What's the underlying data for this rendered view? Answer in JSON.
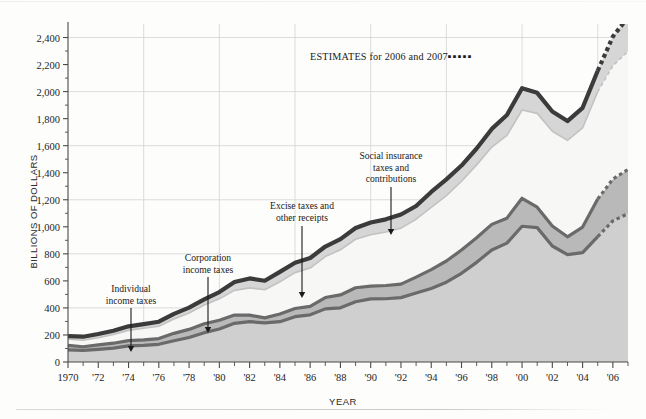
{
  "axes": {
    "ylabel": "BILLIONS OF DOLLARS",
    "xlabel": "YEAR",
    "yticks": [
      "0",
      "200",
      "400",
      "600",
      "800",
      "1,000",
      "1,200",
      "1,400",
      "1,600",
      "1,800",
      "2,000",
      "2,200",
      "2,400"
    ],
    "xticks": [
      "1970",
      "'72",
      "'74",
      "'76",
      "'78",
      "'80",
      "'82",
      "'84",
      "'86",
      "'88",
      "'90",
      "'92",
      "'94",
      "'96",
      "'98",
      "'00",
      "'02",
      "'04",
      "'06"
    ]
  },
  "estimates_note": {
    "text": "ESTIMATES for 2006 and 2007",
    "dots": "▪▪▪▪▪"
  },
  "annotations": [
    {
      "id": "individual",
      "label_line1": "Individual",
      "label_line2": "income taxes"
    },
    {
      "id": "corporation",
      "label_line1": "Corporation",
      "label_line2": "income taxes"
    },
    {
      "id": "excise",
      "label_line1": "Excise taxes and",
      "label_line2": "other receipts"
    },
    {
      "id": "social",
      "label_line1": "Social insurance",
      "label_line2": "taxes and",
      "label_line3": "contributions"
    }
  ],
  "colors": {
    "total_line": "#3b3b3b",
    "band_top_fill": "#d6d6d6",
    "band_social_fill": "#e8e8e8",
    "band_white_fill": "#f7f7f5",
    "band_corp_fill": "#b9b9b9",
    "band_corp_line": "#6a6a6a",
    "band_individual_fill": "#cfcfcf",
    "grid": "#d3d3d3",
    "axis": "#4a4a4a",
    "text": "#1a1a1a"
  },
  "chart_data": {
    "type": "area",
    "title": "",
    "subtitle": "",
    "xlabel": "YEAR",
    "ylabel": "BILLIONS OF DOLLARS",
    "xlim": [
      1970,
      2007
    ],
    "ylim": [
      0,
      2500
    ],
    "ytick_step": 200,
    "grid": "horizontal every 400, vertical every 5 years",
    "legend": "inline annotations with arrows",
    "estimates_years": [
      2006,
      2007
    ],
    "stack_order_bottom_to_top": [
      "Individual income taxes",
      "Corporation income taxes",
      "Excise taxes and other receipts",
      "Social insurance taxes and contributions"
    ],
    "x": [
      1970,
      1971,
      1972,
      1973,
      1974,
      1975,
      1976,
      1977,
      1978,
      1979,
      1980,
      1981,
      1982,
      1983,
      1984,
      1985,
      1986,
      1987,
      1988,
      1989,
      1990,
      1991,
      1992,
      1993,
      1994,
      1995,
      1996,
      1997,
      1998,
      1999,
      2000,
      2001,
      2002,
      2003,
      2004,
      2005,
      2006,
      2007
    ],
    "series": [
      {
        "name": "Individual income taxes",
        "values": [
          90,
          86,
          94,
          103,
          119,
          123,
          131,
          157,
          181,
          217,
          244,
          286,
          298,
          289,
          298,
          335,
          349,
          393,
          401,
          446,
          467,
          468,
          476,
          510,
          543,
          590,
          656,
          737,
          829,
          879,
          1004,
          994,
          858,
          794,
          809,
          927,
          1044,
          1097
        ]
      },
      {
        "name": "Corporation income taxes",
        "values": [
          33,
          27,
          32,
          36,
          39,
          41,
          42,
          55,
          60,
          66,
          65,
          61,
          49,
          37,
          57,
          61,
          63,
          84,
          95,
          103,
          94,
          98,
          100,
          118,
          140,
          157,
          172,
          182,
          189,
          185,
          207,
          151,
          148,
          132,
          189,
          278,
          309,
          327
        ]
      },
      {
        "name": "Social insurance taxes and contributions",
        "values": [
          45,
          48,
          53,
          64,
          76,
          86,
          92,
          106,
          121,
          138,
          158,
          183,
          201,
          209,
          239,
          265,
          283,
          303,
          334,
          359,
          380,
          396,
          414,
          428,
          461,
          484,
          509,
          539,
          572,
          612,
          653,
          694,
          701,
          713,
          733,
          794,
          838,
          874
        ]
      },
      {
        "name": "Excise taxes and other receipts",
        "values": [
          24,
          26,
          28,
          28,
          30,
          30,
          33,
          38,
          40,
          42,
          50,
          62,
          70,
          66,
          73,
          73,
          74,
          74,
          79,
          83,
          91,
          93,
          101,
          98,
          114,
          120,
          116,
          121,
          134,
          151,
          161,
          152,
          146,
          143,
          149,
          155,
          216,
          252
        ]
      }
    ],
    "total_receipts": [
      192,
      187,
      207,
      231,
      264,
      280,
      298,
      356,
      402,
      463,
      517,
      592,
      618,
      601,
      667,
      734,
      769,
      854,
      909,
      991,
      1032,
      1055,
      1091,
      1154,
      1258,
      1351,
      1453,
      1579,
      1724,
      1827,
      2025,
      1991,
      1853,
      1782,
      1880,
      2154,
      2407,
      2550
    ]
  }
}
